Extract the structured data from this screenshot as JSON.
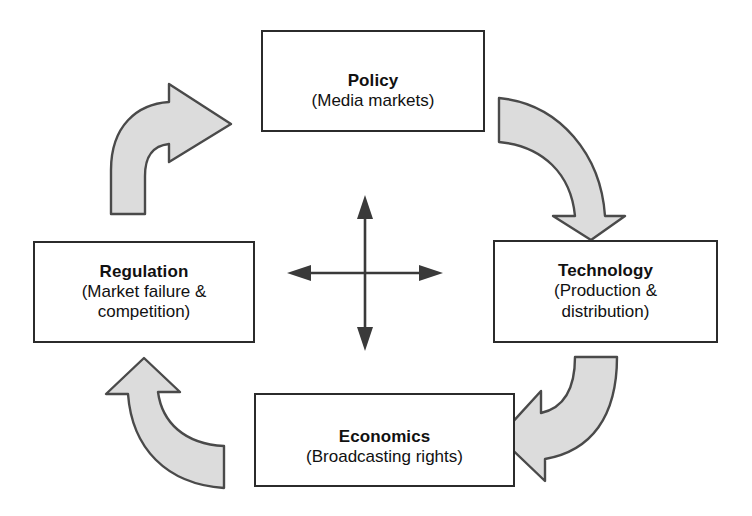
{
  "diagram": {
    "type": "cycle-diagram",
    "colors": {
      "arrow_fill": "#dcdcdc",
      "arrow_stroke": "#4a4a4a",
      "box_stroke": "#2b2b2b",
      "text": "#111111",
      "background": "#ffffff"
    },
    "nodes": [
      {
        "id": "policy",
        "title": "Policy",
        "subtitle": "(Media markets)",
        "subtitle_line1": "(Media markets)",
        "subtitle_line2": ""
      },
      {
        "id": "technology",
        "title": "Technology",
        "subtitle": "(Production & distribution)",
        "subtitle_line1": "(Production &",
        "subtitle_line2": "distribution)"
      },
      {
        "id": "economics",
        "title": "Economics",
        "subtitle": "(Broadcasting rights)",
        "subtitle_line1": "(Broadcasting rights)",
        "subtitle_line2": ""
      },
      {
        "id": "regulation",
        "title": "Regulation",
        "subtitle": "(Market failure & competition)",
        "subtitle_line1": "(Market failure &",
        "subtitle_line2": "competition)"
      }
    ],
    "connectors": [
      {
        "id": "policy-to-technology",
        "from": "Policy",
        "to": "Technology",
        "style": "curved-block-arrow",
        "direction": "clockwise"
      },
      {
        "id": "technology-to-economics",
        "from": "Technology",
        "to": "Economics",
        "style": "curved-block-arrow",
        "direction": "clockwise"
      },
      {
        "id": "economics-to-regulation",
        "from": "Economics",
        "to": "Regulation",
        "style": "curved-block-arrow",
        "direction": "clockwise"
      },
      {
        "id": "regulation-to-policy",
        "from": "Regulation",
        "to": "Policy",
        "style": "curved-block-arrow",
        "direction": "clockwise"
      }
    ],
    "center": {
      "id": "interaction-cross",
      "style": "double-headed-cross",
      "heads": [
        "up",
        "down",
        "left",
        "right"
      ]
    }
  }
}
